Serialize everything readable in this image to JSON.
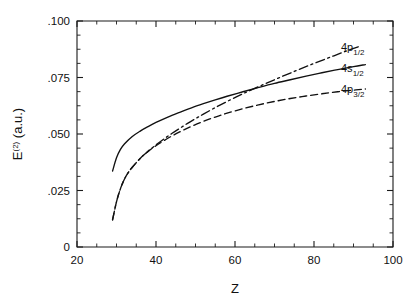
{
  "chart_data": {
    "type": "line",
    "title": "",
    "xlabel": "Z",
    "ylabel": "E(2) (a.u.)",
    "ylabel_base": "E",
    "ylabel_sup": "(2)",
    "ylabel_unit": " (a.u.)",
    "xlim": [
      20,
      100
    ],
    "ylim": [
      0,
      0.1
    ],
    "grid": false,
    "legend_position": "right-inline-labels",
    "xticks": [
      20,
      40,
      60,
      80,
      100
    ],
    "xticklabels": [
      "20",
      "40",
      "60",
      "80",
      "100"
    ],
    "xminorticks": [
      25,
      30,
      35,
      45,
      50,
      55,
      65,
      70,
      75,
      85,
      90,
      95
    ],
    "yticks": [
      0,
      0.025,
      0.05,
      0.075,
      0.1
    ],
    "yticklabels": [
      "0",
      ".025",
      ".050",
      ".075",
      ".100"
    ],
    "yminorticks": [
      0.00625,
      0.0125,
      0.01875,
      0.03125,
      0.0375,
      0.04375,
      0.05625,
      0.0625,
      0.06875,
      0.08125,
      0.0875,
      0.09375
    ],
    "series": [
      {
        "name": "4p_1/2",
        "label_base": "4p",
        "label_sub": "1/2",
        "linestyle": "dashdot",
        "color": "#111111",
        "x": [
          29,
          30,
          31,
          32,
          33,
          34,
          36,
          38,
          40,
          42,
          44,
          46,
          48,
          50,
          52,
          55,
          58,
          61,
          64,
          68,
          72,
          76,
          80,
          84,
          88,
          92
        ],
        "y": [
          0.012,
          0.02,
          0.0258,
          0.03,
          0.033,
          0.0353,
          0.0392,
          0.0424,
          0.0452,
          0.0478,
          0.0502,
          0.0525,
          0.0547,
          0.0568,
          0.0588,
          0.0617,
          0.0644,
          0.067,
          0.0694,
          0.0725,
          0.0755,
          0.0784,
          0.0812,
          0.0839,
          0.0866,
          0.0891
        ]
      },
      {
        "name": "4s_1/2",
        "label_base": "4s",
        "label_sub": "1/2",
        "linestyle": "solid",
        "color": "#111111",
        "x": [
          29,
          30,
          31,
          32,
          34,
          36,
          38,
          40,
          43,
          46,
          49,
          52,
          55,
          58,
          62,
          66,
          70,
          74,
          78,
          82,
          86,
          90,
          93
        ],
        "y": [
          0.0336,
          0.0395,
          0.0432,
          0.0456,
          0.0489,
          0.0513,
          0.0533,
          0.0551,
          0.0575,
          0.0596,
          0.0616,
          0.0634,
          0.0651,
          0.0667,
          0.0687,
          0.0706,
          0.0724,
          0.074,
          0.0756,
          0.0771,
          0.0785,
          0.0798,
          0.0807
        ]
      },
      {
        "name": "4p_3/2",
        "label_base": "4p",
        "label_sub": "3/2",
        "linestyle": "dashed",
        "color": "#111111",
        "x": [
          29,
          30,
          31,
          32,
          33,
          34,
          36,
          38,
          40,
          43,
          46,
          49,
          52,
          55,
          58,
          62,
          66,
          70,
          74,
          78,
          82,
          86,
          90,
          93
        ],
        "y": [
          0.012,
          0.02,
          0.0258,
          0.03,
          0.033,
          0.0353,
          0.0392,
          0.0423,
          0.0448,
          0.0481,
          0.0509,
          0.0534,
          0.0556,
          0.0575,
          0.0592,
          0.0612,
          0.0629,
          0.0644,
          0.0657,
          0.0668,
          0.0678,
          0.0687,
          0.0694,
          0.0699
        ]
      }
    ]
  },
  "plot_area": {
    "left": 77,
    "right": 393,
    "top": 21,
    "bottom": 247
  },
  "curve_label_anchors": [
    {
      "series": 0,
      "x": 341,
      "y": 51
    },
    {
      "series": 1,
      "x": 341,
      "y": 72
    },
    {
      "series": 2,
      "x": 341,
      "y": 93
    }
  ]
}
